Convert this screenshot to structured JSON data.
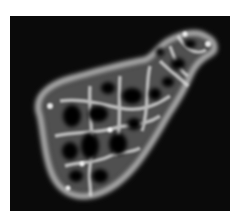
{
  "image": {
    "subject": "fluorescence micrograph of a single cell with reticular network",
    "background_color": "#0a0a0a",
    "page_color": "#ffffff",
    "signal_color": "#e8e8e8"
  }
}
